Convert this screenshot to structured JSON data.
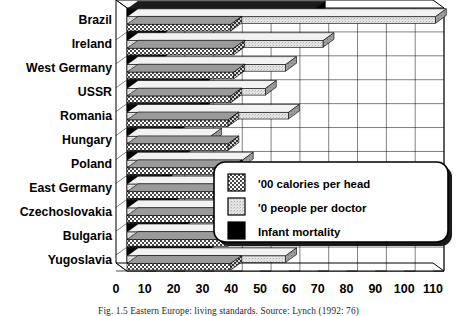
{
  "figure": {
    "caption": "Fig. 1.5  Eastern Europe: living standards.  Source: Lynch (1992: 76)"
  },
  "chart_data": {
    "type": "bar",
    "orientation": "horizontal",
    "style": "3d-grouped-horizontal-bar",
    "title": "",
    "xlabel": "",
    "ylabel": "",
    "xlim": [
      0,
      110
    ],
    "xticks": [
      0,
      10,
      20,
      30,
      40,
      50,
      60,
      70,
      80,
      90,
      100,
      110
    ],
    "xticklabels": [
      "0",
      "10",
      "20",
      "30",
      "40",
      "50",
      "60",
      "70",
      "80",
      "90",
      "100",
      "110"
    ],
    "grid": true,
    "legend_position": "center-right",
    "categories": [
      "Brazil",
      "Ireland",
      "West Germany",
      "USSR",
      "Romania",
      "Hungary",
      "Poland",
      "East Germany",
      "Czechoslovakia",
      "Bulgaria",
      "Yugoslavia"
    ],
    "series": [
      {
        "name": "Infant mortality",
        "key": "infant_mortality",
        "pattern": "solid-black",
        "color": "#000000",
        "values": [
          65,
          10,
          10,
          25,
          25,
          16,
          18,
          12,
          14,
          18,
          26
        ]
      },
      {
        "name": "'0 people per doctor",
        "key": "people_per_doctor",
        "pattern": "light-gray",
        "color": "#d8d8d8",
        "values": [
          107,
          68,
          55,
          48,
          56,
          29,
          40,
          32,
          31,
          31,
          55
        ]
      },
      {
        "name": "'00 calories per head",
        "key": "calories_per_head",
        "pattern": "dark-checker",
        "color": "#8a8a8a",
        "values": [
          36,
          37,
          37,
          36,
          35,
          35,
          36,
          37,
          36,
          35,
          36
        ]
      }
    ]
  },
  "legend": {
    "items": [
      {
        "label": "'00 calories per head",
        "swatch": "dark-checker"
      },
      {
        "label": "'0 people per doctor",
        "swatch": "light-gray"
      },
      {
        "label": "Infant mortality",
        "swatch": "solid-black"
      }
    ]
  }
}
